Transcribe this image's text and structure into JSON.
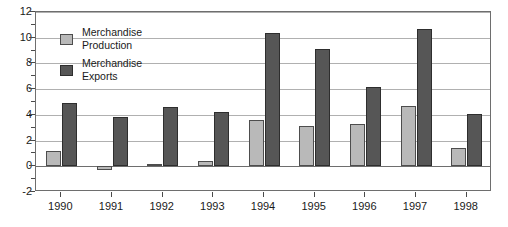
{
  "chart_data": {
    "type": "bar",
    "title": "",
    "subtitle": "",
    "xlabel": "",
    "ylabel": "",
    "categories": [
      "1990",
      "1991",
      "1992",
      "1993",
      "1994",
      "1995",
      "1996",
      "1997",
      "1998"
    ],
    "series": [
      {
        "name": "Merchandise Production",
        "color": "#b9b9b9",
        "values": [
          1.2,
          -0.3,
          0.2,
          0.4,
          3.6,
          3.1,
          3.3,
          4.7,
          1.4
        ]
      },
      {
        "name": "Merchandise Exports",
        "color": "#565656",
        "values": [
          4.9,
          3.8,
          4.6,
          4.2,
          10.4,
          9.1,
          6.2,
          10.7,
          4.1
        ]
      }
    ],
    "ylim": [
      -2,
      12
    ],
    "ytick_labels": [
      "12",
      "10",
      "8",
      "6",
      "4",
      "2",
      "0",
      "-2"
    ],
    "ytick_values": [
      12,
      10,
      8,
      6,
      4,
      2,
      0,
      -2
    ],
    "yminor_values": [
      11,
      9,
      7,
      5,
      3,
      1,
      -1
    ],
    "grid": true,
    "gridlines_at": [
      12,
      10,
      8,
      6,
      4,
      2,
      0
    ],
    "legend_position": "upper-left",
    "legend": [
      {
        "line1": "Merchandise",
        "line2": "Production",
        "swatch": "production"
      },
      {
        "line1": "Merchandise",
        "line2": "Exports",
        "swatch": "exports"
      }
    ]
  },
  "colors": {
    "production": "#b9b9b9",
    "exports": "#565656",
    "frame": "#6e6e6e",
    "grid": "#b0b0b0",
    "text": "#1a1a1a",
    "background": "#ffffff"
  }
}
